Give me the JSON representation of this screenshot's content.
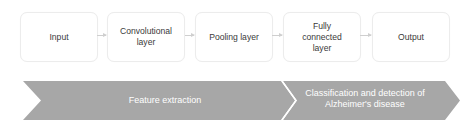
{
  "pipeline": {
    "steps": [
      {
        "label": "Input"
      },
      {
        "label": "Convolutional layer"
      },
      {
        "label": "Pooling layer"
      },
      {
        "label": "Fully connected layer"
      },
      {
        "label": "Output"
      }
    ]
  },
  "phases": [
    {
      "label": "Feature extraction"
    },
    {
      "label": "Classification and detection of Alzheimer's disease"
    }
  ],
  "colors": {
    "band_fill": "#a7a7a7",
    "box_border": "#ececec",
    "arrow": "#cfcfcf",
    "text": "#3a3a3a"
  }
}
